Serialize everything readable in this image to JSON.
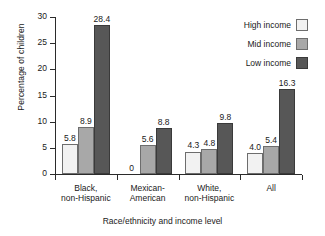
{
  "chart_data": {
    "type": "bar",
    "title": "",
    "xlabel": "Race/ethnicity and income level",
    "ylabel": "Percentage of children",
    "ylim": [
      0,
      30
    ],
    "yticks": [
      0,
      5,
      10,
      15,
      20,
      25,
      30
    ],
    "grid": false,
    "legend_position": "top-right",
    "categories": [
      "Black,\nnon-Hispanic",
      "Mexican-\nAmerican",
      "White,\nnon-Hispanic",
      "All"
    ],
    "series": [
      {
        "name": "High income",
        "color": "#f2f2f2",
        "values": [
          5.8,
          0,
          4.3,
          4.0
        ],
        "labels": [
          "5.8",
          "0",
          "4.3",
          "4.0"
        ]
      },
      {
        "name": "Mid income",
        "color": "#a8a8a8",
        "values": [
          8.9,
          5.6,
          4.8,
          5.4
        ],
        "labels": [
          "8.9",
          "5.6",
          "4.8",
          "5.4"
        ]
      },
      {
        "name": "Low income",
        "color": "#575757",
        "values": [
          28.4,
          8.8,
          9.8,
          16.3
        ],
        "labels": [
          "28.4",
          "8.8",
          "9.8",
          "16.3"
        ]
      }
    ]
  },
  "axes": {
    "y_title": "Percentage of children",
    "x_title": "Race/ethnicity and income level",
    "y_tick_labels": [
      "0",
      "5",
      "10",
      "15",
      "20",
      "25",
      "30"
    ]
  },
  "legend": {
    "items": [
      {
        "label": "High income",
        "swatch": "high"
      },
      {
        "label": "Mid income",
        "swatch": "mid"
      },
      {
        "label": "Low income",
        "swatch": "low"
      }
    ]
  },
  "groups": [
    {
      "label": "Black,\nnon-Hispanic"
    },
    {
      "label": "Mexican-\nAmerican"
    },
    {
      "label": "White,\nnon-Hispanic"
    },
    {
      "label": "All"
    }
  ]
}
